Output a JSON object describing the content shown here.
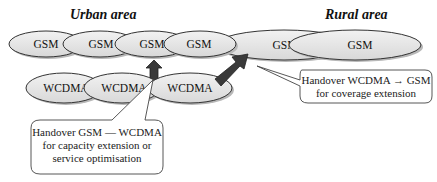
{
  "titles": {
    "urban": "Urban area",
    "rural": "Rural area"
  },
  "urban_gsm_cells": [
    {
      "label": "GSM"
    },
    {
      "label": "GSM"
    },
    {
      "label": "GSM"
    },
    {
      "label": "GSM"
    }
  ],
  "rural_gsm_cells": [
    {
      "label": "GSM"
    },
    {
      "label": "GSM"
    }
  ],
  "wcdma_cells": [
    {
      "label": "WCDMA"
    },
    {
      "label": "WCDMA"
    },
    {
      "label": "WCDMA"
    }
  ],
  "callouts": {
    "rural_handover": {
      "line1": "Handover WCDMA → GSM",
      "line2": "for coverage extension"
    },
    "urban_handover": {
      "line1": "Handover GSM — WCDMA",
      "line2": "for capacity extension or",
      "line3": "service optimisation"
    }
  },
  "colors": {
    "cell_fill": "#e6e6e6",
    "cell_stroke": "#333333",
    "arrow_fill": "#3a3a3a",
    "shadow": "#b8b8b8"
  }
}
